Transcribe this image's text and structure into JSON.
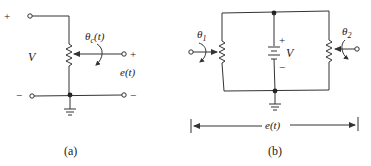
{
  "figure": {
    "panel_a": {
      "caption": "(a)",
      "source_label": "V",
      "angle_label": "θ",
      "angle_subscript": "c",
      "angle_arg": "(t)",
      "output_label": "e(t)",
      "top_terminal_sign": "+",
      "bottom_left_terminal_sign": "−",
      "output_plus_sign": "+",
      "output_minus_sign": "−"
    },
    "panel_b": {
      "caption": "(b)",
      "battery_label": "V",
      "battery_plus": "+",
      "battery_minus": "−",
      "left_angle_label": "θ",
      "left_angle_subscript": "1",
      "right_angle_label": "θ",
      "right_angle_subscript": "2",
      "output_label": "e(t)"
    },
    "colors": {
      "line": "#333333",
      "text": "#222222",
      "background": "#ffffff"
    }
  }
}
